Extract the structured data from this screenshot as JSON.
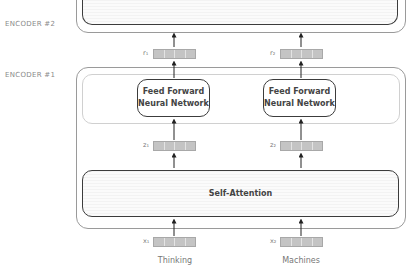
{
  "encoders": [
    {
      "id": 2,
      "label": "ENCODER #2"
    },
    {
      "id": 1,
      "label": "ENCODER #1"
    }
  ],
  "layers": {
    "feed_forward": [
      {
        "label_line1": "Feed Forward",
        "label_line2": "Neural Network"
      },
      {
        "label_line1": "Feed Forward",
        "label_line2": "Neural Network"
      }
    ],
    "self_attention": {
      "label": "Self-Attention"
    }
  },
  "vectors": {
    "outputs": [
      {
        "label": "r₁"
      },
      {
        "label": "r₂"
      }
    ],
    "intermediate": [
      {
        "label": "z₁"
      },
      {
        "label": "z₂"
      }
    ],
    "inputs": [
      {
        "label": "x₁"
      },
      {
        "label": "x₂"
      }
    ]
  },
  "words": [
    "Thinking",
    "Machines"
  ],
  "colors": {
    "outer_border": "#9a9a9a",
    "inner_border": "#d0d0d0",
    "box_border": "#3c3c3c",
    "vector_fill": "#c4c4c4",
    "label_text": "#8a8a8a"
  }
}
